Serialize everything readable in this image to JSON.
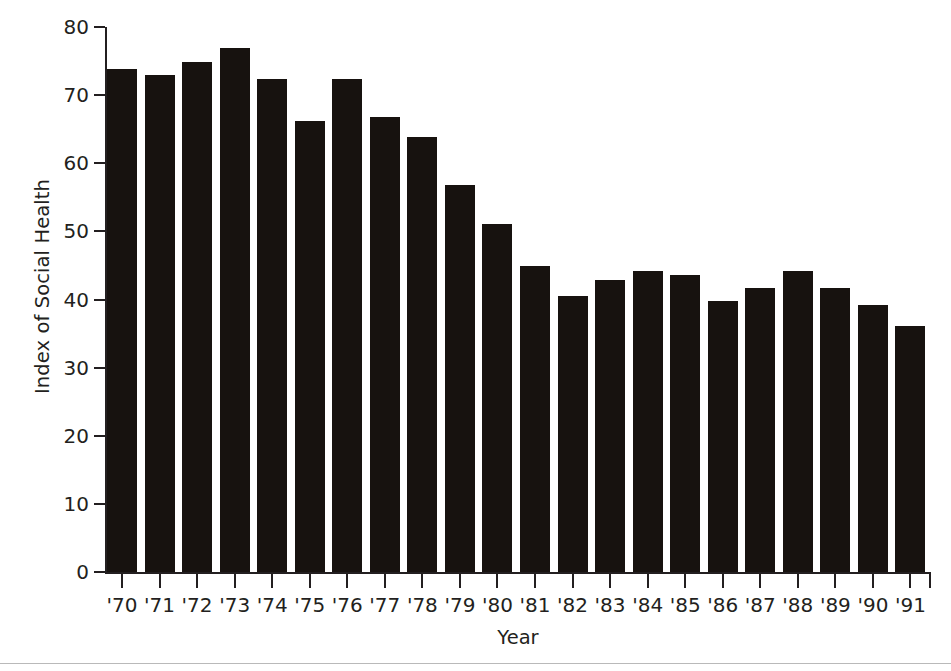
{
  "chart_data": {
    "type": "bar",
    "title": "",
    "subtitle": "",
    "xlabel": "Year",
    "ylabel": "Index of Social Health",
    "categories": [
      "'70",
      "'71",
      "'72",
      "'73",
      "'74",
      "'75",
      "'76",
      "'77",
      "'78",
      "'79",
      "'80",
      "'81",
      "'82",
      "'83",
      "'84",
      "'85",
      "'86",
      "'87",
      "'88",
      "'89",
      "'90",
      "'91"
    ],
    "values": [
      73.8,
      73.0,
      74.9,
      76.9,
      72.3,
      66.2,
      72.3,
      66.8,
      63.8,
      56.8,
      51.1,
      44.9,
      40.5,
      42.9,
      44.2,
      43.6,
      39.8,
      41.7,
      44.2,
      41.7,
      39.2,
      36.1
    ],
    "series": [
      {
        "name": "Index of Social Health",
        "values": [
          73.8,
          73.0,
          74.9,
          76.9,
          72.3,
          66.2,
          72.3,
          66.8,
          63.8,
          56.8,
          51.1,
          44.9,
          40.5,
          42.9,
          44.2,
          43.6,
          39.8,
          41.7,
          44.2,
          41.7,
          39.2,
          36.1
        ]
      }
    ],
    "ylim": [
      0,
      80
    ],
    "yticks": [
      0,
      10,
      20,
      30,
      40,
      50,
      60,
      70,
      80
    ],
    "ytick_labels": [
      "0",
      "10",
      "20",
      "30",
      "40",
      "50",
      "60",
      "70",
      "80"
    ],
    "grid": false,
    "legend": null,
    "legend_position": "none",
    "bar_color": "#17120f",
    "axis_color": "#231f20",
    "background_color": "#ffffff",
    "annotations": []
  }
}
